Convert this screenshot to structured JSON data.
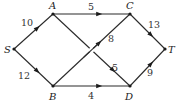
{
  "diagram": {
    "type": "directed-weighted-network",
    "nodes": [
      {
        "id": "S",
        "label": "S",
        "x": 14,
        "y": 49,
        "lx": 4,
        "ly": 53
      },
      {
        "id": "A",
        "label": "A",
        "x": 53,
        "y": 14,
        "lx": 49,
        "ly": 9
      },
      {
        "id": "C",
        "label": "C",
        "x": 130,
        "y": 14,
        "lx": 126,
        "ly": 9
      },
      {
        "id": "T",
        "label": "T",
        "x": 165,
        "y": 49,
        "lx": 168,
        "ly": 53
      },
      {
        "id": "B",
        "label": "B",
        "x": 53,
        "y": 86,
        "lx": 49,
        "ly": 100
      },
      {
        "id": "D",
        "label": "D",
        "x": 130,
        "y": 86,
        "lx": 125,
        "ly": 100
      }
    ],
    "edges": [
      {
        "from": "S",
        "to": "A",
        "weight": "10",
        "lx": 21,
        "ly": 26
      },
      {
        "from": "S",
        "to": "B",
        "weight": "12",
        "lx": 18,
        "ly": 79
      },
      {
        "from": "A",
        "to": "C",
        "weight": "5",
        "lx": 88,
        "ly": 10
      },
      {
        "from": "A",
        "to": "D",
        "weight": "5",
        "lx": 112,
        "ly": 71
      },
      {
        "from": "B",
        "to": "C",
        "weight": "8",
        "lx": 108,
        "ly": 42
      },
      {
        "from": "B",
        "to": "D",
        "weight": "4",
        "lx": 88,
        "ly": 99
      },
      {
        "from": "C",
        "to": "T",
        "weight": "13",
        "lx": 148,
        "ly": 28
      },
      {
        "from": "D",
        "to": "T",
        "weight": "9",
        "lx": 147,
        "ly": 76
      }
    ]
  }
}
